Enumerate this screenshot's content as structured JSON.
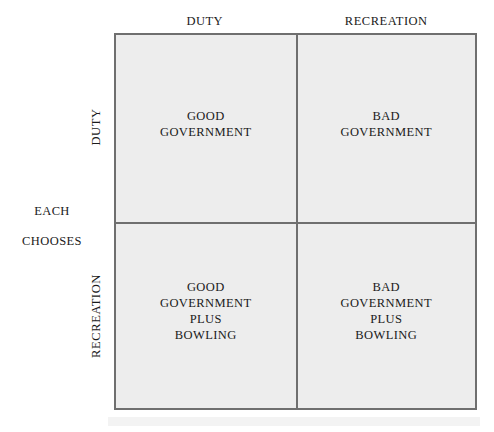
{
  "diagram": {
    "type": "2x2-matrix",
    "row_axis_label_lines": [
      "EACH",
      "CHOOSES"
    ],
    "column_headers": [
      "DUTY",
      "RECREATION"
    ],
    "row_headers": [
      "DUTY",
      "RECREATION"
    ],
    "cells": [
      {
        "row": "DUTY",
        "column": "DUTY",
        "text": "GOOD\nGOVERNMENT"
      },
      {
        "row": "DUTY",
        "column": "RECREATION",
        "text": "BAD\nGOVERNMENT"
      },
      {
        "row": "RECREATION",
        "column": "DUTY",
        "text": "GOOD\nGOVERNMENT\nPLUS\nBOWLING"
      },
      {
        "row": "RECREATION",
        "column": "RECREATION",
        "text": "BAD\nGOVERNMENT\nPLUS\nBOWLING"
      }
    ],
    "colors": {
      "cell_fill": "#ededed",
      "border": "#6f6f6f",
      "text": "#1a1a1a",
      "background": "#ffffff"
    }
  }
}
